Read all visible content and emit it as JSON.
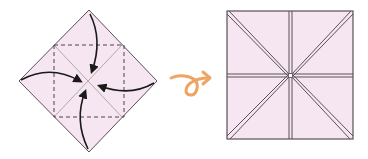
{
  "diagram": {
    "steps": [
      {
        "id": "before",
        "description": "Square paper in diamond orientation with dashed fold lines; four curved arrows show each corner folding to the center",
        "paper_color": "#f6e6f1",
        "edge_color": "#5a5058",
        "crease_color": "#a8a0a6",
        "dashed_line_color": "#4a4248",
        "arrow_color": "#1a1a1a",
        "arrows": [
          "top-to-center",
          "right-to-center",
          "bottom-to-center",
          "left-to-center"
        ]
      },
      {
        "id": "after",
        "description": "Resulting smaller square with four flaps meeting at the center",
        "paper_color": "#f6e6f1",
        "edge_color": "#5a5058"
      }
    ],
    "transition_arrow": {
      "name": "loop-arrow",
      "color": "#f0a463"
    }
  }
}
